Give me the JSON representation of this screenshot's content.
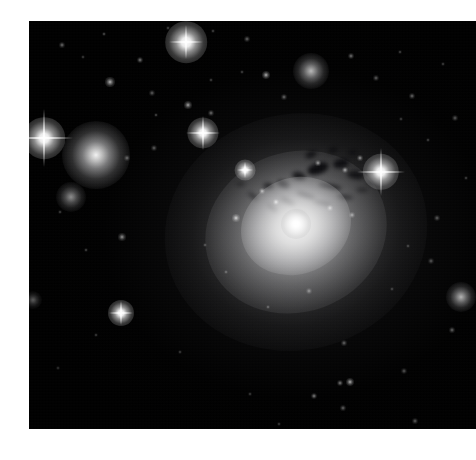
{
  "page": {
    "background_color": "#ffffff",
    "width": 476,
    "height": 460
  },
  "plate": {
    "name": "astronomical-image",
    "alt_text": "Deep telescope image of the giant elliptical galaxy NGC 1275 (Perseus A) at the centre of the Perseus galaxy cluster, showing dark dust filaments silhouetted against a bright diffuse halo, surrounded by foreground stars with diffraction spikes and companion elliptical galaxies.",
    "x": 29,
    "y": 21,
    "width": 447,
    "height": 408,
    "sky_color": "#000000",
    "halo_color": "#e8e8e8",
    "nucleus_color": "#ffffff",
    "dust_color": "#07070a"
  },
  "objects": {
    "main_galaxy": {
      "label": "NGC 1275",
      "cx": 296,
      "cy": 232,
      "outer_rx": 132,
      "outer_ry": 118,
      "mid_rx": 92,
      "mid_ry": 80,
      "inner_rx": 56,
      "inner_ry": 48,
      "nucleus_r": 15
    },
    "elliptical_galaxies": [
      {
        "label": "companion-elliptical-left",
        "cx": 96,
        "cy": 155,
        "r": 34,
        "brightness": 0.95
      },
      {
        "label": "companion-elliptical-lower-left",
        "cx": 71,
        "cy": 197,
        "r": 15,
        "brightness": 0.55
      },
      {
        "label": "companion-elliptical-upper-right",
        "cx": 311,
        "cy": 71,
        "r": 18,
        "brightness": 0.72
      },
      {
        "label": "companion-elliptical-right",
        "cx": 461,
        "cy": 297,
        "r": 15,
        "brightness": 0.7
      },
      {
        "label": "companion-elliptical-far-left-edge",
        "cx": 33,
        "cy": 300,
        "r": 9,
        "brightness": 0.35
      }
    ],
    "spike_stars": [
      {
        "label": "bright-star-left",
        "cx": 44,
        "cy": 138,
        "core": 8,
        "spike": 58
      },
      {
        "label": "bright-star-right",
        "cx": 381,
        "cy": 172,
        "core": 7,
        "spike": 48
      },
      {
        "label": "bright-star-upper-middle",
        "cx": 186,
        "cy": 42,
        "core": 8,
        "spike": 34
      },
      {
        "label": "bright-star-mid-left",
        "cx": 203,
        "cy": 133,
        "core": 6,
        "spike": 34
      },
      {
        "label": "bright-star-lower-left",
        "cx": 121,
        "cy": 313,
        "core": 5,
        "spike": 24
      },
      {
        "label": "bright-star-bottom-middle",
        "cx": 245,
        "cy": 170,
        "core": 4,
        "spike": 16
      }
    ],
    "field_stars": [
      {
        "cx": 62,
        "cy": 45,
        "r": 1.2,
        "b": 0.45
      },
      {
        "cx": 104,
        "cy": 34,
        "r": 1.0,
        "b": 0.38
      },
      {
        "cx": 140,
        "cy": 60,
        "r": 1.3,
        "b": 0.5
      },
      {
        "cx": 83,
        "cy": 57,
        "r": 0.9,
        "b": 0.3
      },
      {
        "cx": 110,
        "cy": 82,
        "r": 1.9,
        "b": 0.72
      },
      {
        "cx": 168,
        "cy": 28,
        "r": 1.0,
        "b": 0.35
      },
      {
        "cx": 152,
        "cy": 93,
        "r": 1.1,
        "b": 0.4
      },
      {
        "cx": 213,
        "cy": 31,
        "r": 1.0,
        "b": 0.34
      },
      {
        "cx": 247,
        "cy": 39,
        "r": 1.1,
        "b": 0.42
      },
      {
        "cx": 242,
        "cy": 72,
        "r": 1.0,
        "b": 0.33
      },
      {
        "cx": 266,
        "cy": 75,
        "r": 1.7,
        "b": 0.7
      },
      {
        "cx": 284,
        "cy": 97,
        "r": 1.2,
        "b": 0.44
      },
      {
        "cx": 211,
        "cy": 80,
        "r": 1.0,
        "b": 0.33
      },
      {
        "cx": 188,
        "cy": 105,
        "r": 1.6,
        "b": 0.66
      },
      {
        "cx": 211,
        "cy": 113,
        "r": 1.2,
        "b": 0.45
      },
      {
        "cx": 156,
        "cy": 115,
        "r": 1.0,
        "b": 0.36
      },
      {
        "cx": 154,
        "cy": 148,
        "r": 1.1,
        "b": 0.4
      },
      {
        "cx": 127,
        "cy": 158,
        "r": 1.2,
        "b": 0.42
      },
      {
        "cx": 122,
        "cy": 237,
        "r": 1.5,
        "b": 0.58
      },
      {
        "cx": 86,
        "cy": 250,
        "r": 1.0,
        "b": 0.34
      },
      {
        "cx": 60,
        "cy": 212,
        "r": 1.0,
        "b": 0.32
      },
      {
        "cx": 351,
        "cy": 56,
        "r": 1.3,
        "b": 0.48
      },
      {
        "cx": 376,
        "cy": 78,
        "r": 1.1,
        "b": 0.4
      },
      {
        "cx": 400,
        "cy": 52,
        "r": 1.0,
        "b": 0.34
      },
      {
        "cx": 412,
        "cy": 96,
        "r": 1.2,
        "b": 0.44
      },
      {
        "cx": 443,
        "cy": 64,
        "r": 1.0,
        "b": 0.33
      },
      {
        "cx": 455,
        "cy": 118,
        "r": 1.1,
        "b": 0.38
      },
      {
        "cx": 428,
        "cy": 140,
        "r": 1.0,
        "b": 0.32
      },
      {
        "cx": 401,
        "cy": 119,
        "r": 1.0,
        "b": 0.31
      },
      {
        "cx": 466,
        "cy": 178,
        "r": 1.0,
        "b": 0.32
      },
      {
        "cx": 437,
        "cy": 218,
        "r": 1.1,
        "b": 0.38
      },
      {
        "cx": 408,
        "cy": 246,
        "r": 1.0,
        "b": 0.33
      },
      {
        "cx": 431,
        "cy": 261,
        "r": 1.1,
        "b": 0.36
      },
      {
        "cx": 392,
        "cy": 289,
        "r": 1.0,
        "b": 0.31
      },
      {
        "cx": 344,
        "cy": 343,
        "r": 1.2,
        "b": 0.42
      },
      {
        "cx": 452,
        "cy": 330,
        "r": 1.2,
        "b": 0.42
      },
      {
        "cx": 350,
        "cy": 382,
        "r": 1.8,
        "b": 0.7
      },
      {
        "cx": 340,
        "cy": 383,
        "r": 1.3,
        "b": 0.5
      },
      {
        "cx": 314,
        "cy": 396,
        "r": 1.4,
        "b": 0.52
      },
      {
        "cx": 343,
        "cy": 408,
        "r": 1.2,
        "b": 0.42
      },
      {
        "cx": 404,
        "cy": 371,
        "r": 1.1,
        "b": 0.36
      },
      {
        "cx": 415,
        "cy": 421,
        "r": 1.2,
        "b": 0.4
      },
      {
        "cx": 250,
        "cy": 394,
        "r": 1.0,
        "b": 0.31
      },
      {
        "cx": 279,
        "cy": 424,
        "r": 1.0,
        "b": 0.3
      },
      {
        "cx": 180,
        "cy": 352,
        "r": 1.0,
        "b": 0.3
      },
      {
        "cx": 96,
        "cy": 335,
        "r": 1.0,
        "b": 0.3
      },
      {
        "cx": 58,
        "cy": 368,
        "r": 0.9,
        "b": 0.26
      },
      {
        "cx": 236,
        "cy": 218,
        "r": 1.6,
        "b": 0.78
      },
      {
        "cx": 276,
        "cy": 202,
        "r": 1.4,
        "b": 0.72
      },
      {
        "cx": 262,
        "cy": 191,
        "r": 1.2,
        "b": 0.62
      },
      {
        "cx": 330,
        "cy": 208,
        "r": 1.2,
        "b": 0.6
      },
      {
        "cx": 352,
        "cy": 215,
        "r": 1.1,
        "b": 0.55
      },
      {
        "cx": 318,
        "cy": 163,
        "r": 1.2,
        "b": 0.6
      },
      {
        "cx": 345,
        "cy": 170,
        "r": 1.3,
        "b": 0.62
      },
      {
        "cx": 360,
        "cy": 158,
        "r": 1.2,
        "b": 0.58
      },
      {
        "cx": 309,
        "cy": 291,
        "r": 1.1,
        "b": 0.46
      },
      {
        "cx": 268,
        "cy": 307,
        "r": 1.0,
        "b": 0.4
      },
      {
        "cx": 226,
        "cy": 272,
        "r": 1.0,
        "b": 0.38
      },
      {
        "cx": 205,
        "cy": 245,
        "r": 1.0,
        "b": 0.36
      }
    ],
    "dust_filaments": [
      {
        "cx": 318,
        "cy": 168,
        "w": 22,
        "h": 11,
        "rot": -18,
        "op": 0.92
      },
      {
        "cx": 341,
        "cy": 163,
        "w": 16,
        "h": 9,
        "rot": -12,
        "op": 0.88
      },
      {
        "cx": 299,
        "cy": 176,
        "w": 14,
        "h": 8,
        "rot": 14,
        "op": 0.8
      },
      {
        "cx": 283,
        "cy": 184,
        "w": 13,
        "h": 7,
        "rot": 22,
        "op": 0.75
      },
      {
        "cx": 268,
        "cy": 186,
        "w": 11,
        "h": 6,
        "rot": 8,
        "op": 0.68
      },
      {
        "cx": 356,
        "cy": 175,
        "w": 18,
        "h": 8,
        "rot": 6,
        "op": 0.8
      },
      {
        "cx": 374,
        "cy": 183,
        "w": 14,
        "h": 6,
        "rot": 14,
        "op": 0.7
      },
      {
        "cx": 330,
        "cy": 186,
        "w": 24,
        "h": 5,
        "rot": 10,
        "op": 0.72
      },
      {
        "cx": 306,
        "cy": 195,
        "w": 20,
        "h": 5,
        "rot": 18,
        "op": 0.7
      },
      {
        "cx": 288,
        "cy": 201,
        "w": 16,
        "h": 5,
        "rot": 26,
        "op": 0.62
      },
      {
        "cx": 322,
        "cy": 203,
        "w": 18,
        "h": 4,
        "rot": 12,
        "op": 0.6
      },
      {
        "cx": 345,
        "cy": 197,
        "w": 16,
        "h": 4,
        "rot": 8,
        "op": 0.58
      },
      {
        "cx": 253,
        "cy": 196,
        "w": 12,
        "h": 4,
        "rot": 34,
        "op": 0.52
      },
      {
        "cx": 272,
        "cy": 208,
        "w": 13,
        "h": 4,
        "rot": 40,
        "op": 0.5
      },
      {
        "cx": 300,
        "cy": 213,
        "w": 14,
        "h": 4,
        "rot": 20,
        "op": 0.48
      },
      {
        "cx": 362,
        "cy": 190,
        "w": 12,
        "h": 4,
        "rot": 4,
        "op": 0.52
      },
      {
        "cx": 240,
        "cy": 184,
        "w": 9,
        "h": 4,
        "rot": -6,
        "op": 0.44
      },
      {
        "cx": 311,
        "cy": 154,
        "w": 12,
        "h": 7,
        "rot": -24,
        "op": 0.74
      },
      {
        "cx": 333,
        "cy": 150,
        "w": 10,
        "h": 6,
        "rot": -16,
        "op": 0.66
      },
      {
        "cx": 352,
        "cy": 152,
        "w": 9,
        "h": 5,
        "rot": -8,
        "op": 0.58
      }
    ]
  }
}
